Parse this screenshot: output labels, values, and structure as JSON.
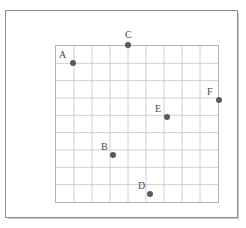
{
  "figure": {
    "background_color": "#ffffff",
    "frame_color": "#8d8d8d",
    "grid_line_color": "#c4c4c4",
    "grid_border_color": "#b4b4b4",
    "point_color": "#5a5a5a",
    "label_color": "#4a4a4a"
  },
  "chart_data": {
    "type": "scatter",
    "title": "",
    "xlabel": "",
    "ylabel": "",
    "grid": true,
    "legend": false,
    "xlim": [
      0,
      9
    ],
    "ylim": [
      0,
      9
    ],
    "x_tick_labels": [],
    "y_tick_labels": [],
    "grid_columns": 9,
    "grid_rows": 9,
    "labels": [
      "A",
      "B",
      "C",
      "D",
      "E",
      "F"
    ],
    "x": [
      1.0,
      3.2,
      4.0,
      5.2,
      6.1,
      9.0
    ],
    "y": [
      8.0,
      3.4,
      9.0,
      0.5,
      5.7,
      6.4
    ],
    "points": [
      {
        "label": "A",
        "x": 1.0,
        "y": 8.0,
        "px": 73,
        "py": 63,
        "label_dx": -14,
        "label_dy": -13
      },
      {
        "label": "B",
        "x": 3.2,
        "y": 3.4,
        "px": 113,
        "py": 155,
        "label_dx": -12,
        "label_dy": -13
      },
      {
        "label": "C",
        "x": 4.0,
        "y": 9.0,
        "px": 128,
        "py": 45,
        "label_dx": -3,
        "label_dy": -15
      },
      {
        "label": "D",
        "x": 5.2,
        "y": 0.5,
        "px": 150,
        "py": 194,
        "label_dx": -12,
        "label_dy": -13
      },
      {
        "label": "E",
        "x": 6.1,
        "y": 5.7,
        "px": 167,
        "py": 117,
        "label_dx": -12,
        "label_dy": -13
      },
      {
        "label": "F",
        "x": 9.0,
        "y": 6.4,
        "px": 219,
        "py": 100,
        "label_dx": -12,
        "label_dy": -13
      }
    ]
  }
}
